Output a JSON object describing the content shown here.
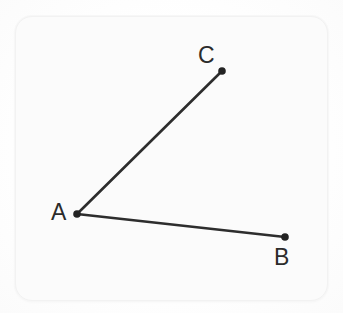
{
  "figure": {
    "kind": "angle-diagram",
    "stroke_color": "#2d2d2d",
    "stroke_width": 2.6,
    "dot_color": "#232323",
    "dot_radius": 3.8,
    "card_background": "#fbfbfb",
    "card_border_color": "#f2f2f2",
    "page_background": "#fefefe",
    "label_color": "#2b2b2b",
    "points": [
      {
        "id": "A",
        "label": "A",
        "x": 77,
        "y": 214,
        "role": "vertex"
      },
      {
        "id": "B",
        "label": "B",
        "x": 285,
        "y": 237,
        "role": "endpoint"
      },
      {
        "id": "C",
        "label": "C",
        "x": 222,
        "y": 71,
        "role": "endpoint"
      }
    ],
    "segments": [
      {
        "id": "AB",
        "from": "A",
        "to": "B"
      },
      {
        "id": "AC",
        "from": "A",
        "to": "C"
      }
    ],
    "labels": {
      "A": "A",
      "B": "B",
      "C": "C"
    }
  }
}
